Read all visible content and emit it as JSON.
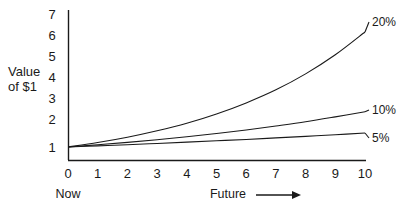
{
  "chart_data": {
    "type": "line",
    "title": "",
    "subtitle": "",
    "xlabel": "Future",
    "ylabel": "Value of $1",
    "xlim": [
      0,
      10
    ],
    "ylim": [
      0,
      7
    ],
    "grid": false,
    "legend_position": "right-of-line-ends",
    "x_tick_labels": [
      "0",
      "1",
      "2",
      "3",
      "4",
      "5",
      "6",
      "7",
      "8",
      "9",
      "10"
    ],
    "y_tick_labels": [
      "1",
      "2",
      "3",
      "4",
      "5",
      "6",
      "7"
    ],
    "x": [
      0,
      1,
      2,
      3,
      4,
      5,
      6,
      7,
      8,
      9,
      10
    ],
    "series": [
      {
        "name": "20%",
        "label": "20%",
        "values": [
          1.0,
          1.2,
          1.44,
          1.73,
          2.07,
          2.49,
          2.99,
          3.58,
          4.3,
          5.16,
          6.19
        ]
      },
      {
        "name": "10%",
        "label": "10%",
        "values": [
          1.0,
          1.1,
          1.21,
          1.33,
          1.46,
          1.61,
          1.77,
          1.95,
          2.14,
          2.36,
          2.59
        ]
      },
      {
        "name": "5%",
        "label": "5%",
        "values": [
          1.0,
          1.05,
          1.1,
          1.16,
          1.22,
          1.28,
          1.34,
          1.41,
          1.48,
          1.55,
          1.63
        ]
      }
    ],
    "annotations": [
      {
        "text": "Now",
        "anchor": "x=0"
      },
      {
        "text": "Future",
        "anchor": "x-axis-right",
        "has_arrow": true
      }
    ],
    "colors": {
      "axis": "#1a1a1a",
      "curve": "#1a1a1a",
      "text": "#1a1a1a",
      "background": "#ffffff"
    }
  },
  "axis": {
    "y_title_line1": "Value",
    "y_title_line2": "of $1"
  },
  "ticks": {
    "y": [
      "7",
      "6",
      "5",
      "4",
      "3",
      "2",
      "1"
    ],
    "x": [
      "0",
      "1",
      "2",
      "3",
      "4",
      "5",
      "6",
      "7",
      "8",
      "9",
      "10"
    ]
  },
  "series_labels": {
    "high": "20%",
    "mid": "10%",
    "low": "5%"
  },
  "annotations": {
    "now": "Now",
    "future": "Future"
  }
}
